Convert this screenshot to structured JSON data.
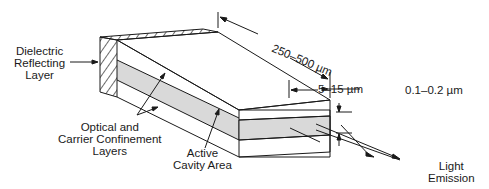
{
  "diagram": {
    "labels": {
      "dielectric": [
        "Dielectric",
        "Reflecting",
        "Layer"
      ],
      "confinement": [
        "Optical and",
        "Carrier Confinement",
        "Layers"
      ],
      "active": [
        "Active",
        "Cavity Area"
      ],
      "emission": [
        "Light",
        "Emission"
      ],
      "length": "250–500 µm",
      "width": "5–15 µm",
      "thickness": "0.1–0.2 µm"
    },
    "colors": {
      "line": "#1a1a1a",
      "active_fill": "#d9d9d9",
      "background": "#ffffff"
    }
  }
}
